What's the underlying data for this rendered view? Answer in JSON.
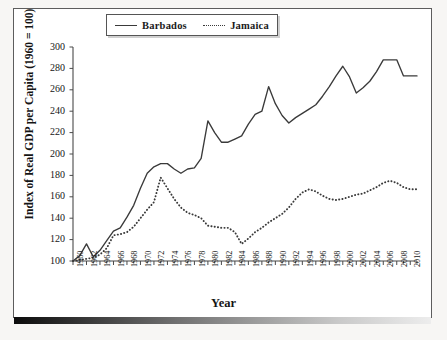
{
  "chart_data": {
    "type": "line",
    "title": "",
    "xlabel": "Year",
    "ylabel": "Index of Real GDP per Capita (1960 = 100)",
    "xlim": [
      1960,
      2011
    ],
    "ylim": [
      100,
      300
    ],
    "yticks": [
      100,
      120,
      140,
      160,
      180,
      200,
      220,
      240,
      260,
      280,
      300
    ],
    "xticks": [
      1960,
      1962,
      1964,
      1966,
      1968,
      1970,
      1972,
      1974,
      1976,
      1978,
      1980,
      1982,
      1984,
      1986,
      1988,
      1990,
      1992,
      1994,
      1996,
      1998,
      2000,
      2002,
      2004,
      2006,
      2008,
      2010
    ],
    "grid": false,
    "legend_position": "top-center",
    "x": [
      1960,
      1961,
      1962,
      1963,
      1964,
      1965,
      1966,
      1967,
      1968,
      1969,
      1970,
      1971,
      1972,
      1973,
      1974,
      1975,
      1976,
      1977,
      1978,
      1979,
      1980,
      1981,
      1982,
      1983,
      1984,
      1985,
      1986,
      1987,
      1988,
      1989,
      1990,
      1991,
      1992,
      1993,
      1994,
      1995,
      1996,
      1997,
      1998,
      1999,
      2000,
      2001,
      2002,
      2003,
      2004,
      2005,
      2006,
      2007,
      2008,
      2009,
      2010,
      2011
    ],
    "series": [
      {
        "name": "Barbados",
        "style": "solid",
        "color": "#3a3a3a",
        "values": [
          100,
          105,
          116,
          104,
          110,
          119,
          128,
          131,
          141,
          152,
          168,
          182,
          188,
          191,
          191,
          186,
          182,
          186,
          187,
          196,
          231,
          220,
          211,
          211,
          214,
          217,
          228,
          237,
          240,
          263,
          247,
          236,
          229,
          234,
          238,
          242,
          246,
          254,
          263,
          273,
          282,
          272,
          257,
          262,
          268,
          277,
          288,
          288,
          288,
          273,
          273,
          273
        ]
      },
      {
        "name": "Jamaica",
        "style": "dotted",
        "color": "#3a3a3a",
        "values": [
          100,
          101,
          102,
          103,
          106,
          112,
          124,
          125,
          127,
          132,
          140,
          148,
          155,
          178,
          168,
          158,
          150,
          145,
          143,
          140,
          133,
          132,
          131,
          131,
          127,
          116,
          121,
          127,
          131,
          136,
          140,
          144,
          150,
          158,
          164,
          167,
          165,
          161,
          158,
          157,
          158,
          160,
          162,
          163,
          166,
          169,
          173,
          175,
          173,
          169,
          167,
          167
        ]
      }
    ]
  },
  "legend": {
    "items": [
      {
        "label": "Barbados",
        "style": "solid"
      },
      {
        "label": "Jamaica",
        "style": "dotted"
      }
    ]
  },
  "axis": {
    "y_title": "Index of Real GDP per Capita (1960 = 100)",
    "x_title": "Year"
  }
}
